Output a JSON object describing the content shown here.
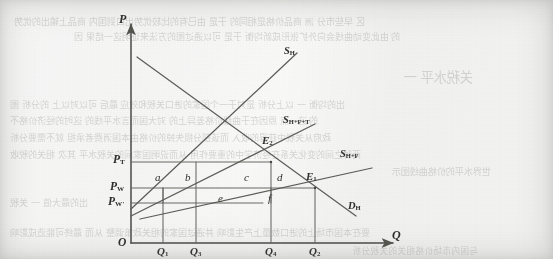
{
  "figure": {
    "kind": "supply-demand tariff welfare diagram",
    "axes": {
      "y_label": "P",
      "y_sublabel": "",
      "x_label": "Q",
      "x_sublabel": "",
      "origin_label": "O"
    },
    "curves": [
      {
        "id": "sh",
        "label": "S",
        "sub": "H",
        "name": "domestic-supply-curve"
      },
      {
        "id": "shft",
        "label": "S",
        "sub": "H+F+T",
        "name": "supply-with-tariff-curve"
      },
      {
        "id": "shf",
        "label": "S",
        "sub": "H+F",
        "name": "supply-free-trade-curve"
      },
      {
        "id": "dh",
        "label": "D",
        "sub": "H",
        "name": "domestic-demand-curve"
      }
    ],
    "price_levels": [
      {
        "id": "pt",
        "label": "P",
        "sub": "T",
        "name": "price-tariff"
      },
      {
        "id": "pw",
        "label": "P",
        "sub": "W",
        "name": "price-world"
      },
      {
        "id": "pw2",
        "label": "P",
        "sub": "W'",
        "name": "price-world-prime"
      }
    ],
    "quantities": [
      {
        "id": "q1",
        "label": "Q",
        "sub": "1"
      },
      {
        "id": "q3",
        "label": "Q",
        "sub": "3"
      },
      {
        "id": "q4",
        "label": "Q",
        "sub": "4"
      },
      {
        "id": "q2",
        "label": "Q",
        "sub": "2"
      }
    ],
    "equilibria": [
      {
        "id": "e2",
        "label": "E",
        "sub": "2"
      },
      {
        "id": "e1",
        "label": "E",
        "sub": "1"
      }
    ],
    "areas": [
      {
        "id": "a",
        "label": "a"
      },
      {
        "id": "b",
        "label": "b"
      },
      {
        "id": "c",
        "label": "c"
      },
      {
        "id": "d",
        "label": "d"
      },
      {
        "id": "e",
        "label": "e"
      },
      {
        "id": "f",
        "label": "f"
      }
    ],
    "colors": {
      "paper": "#eaeae8",
      "ink": "#3a3a39",
      "line": "#6e6e6b",
      "bleed_text": "#b9b9b5"
    }
  },
  "bleed_text": {
    "lines": [
      {
        "text": "区  早些市分  洲  商品价格是相同的  于是  由已有的比较优势出口到国内  商品上输出的优势",
        "x": 14,
        "y": 14,
        "size": 9.2
      },
      {
        "text": "的  由此变动曲线会向外扩张形成新均衡  于是  可以通过图的方法来证明这一结果  因",
        "x": 74,
        "y": 30,
        "size": 9.0
      },
      {
        "text": "关税水平  一",
        "x": 404,
        "y": 66,
        "size": 13.5
      },
      {
        "text": "出的均衡  一  以上分析  是对于一个国家的进口关税和效应  最后  可以对以上  的分析  图",
        "x": 10,
        "y": 98,
        "size": 9.0
      },
      {
        "text": "的  这一点  原因在于曲线价格差异上的  对大国而言水平线的  这时的经济价格不",
        "x": 10,
        "y": 114,
        "size": 9.0
      },
      {
        "text": "政府从关税中获得的收入  而该部分损失掉的价格由本国消费者承担  就不需要分析",
        "x": 10,
        "y": 131,
        "size": 9.0
      },
      {
        "text": "两种之间的变化关系在经济学中的重要作用  从而说明国家间的关税水平  其次  相关的税收",
        "x": 10,
        "y": 148,
        "size": 9.0
      },
      {
        "text": "世界水平的价格曲线图示",
        "x": 392,
        "y": 164,
        "size": 9.4
      },
      {
        "text": "出的最大值  一  关税",
        "x": 10,
        "y": 196,
        "size": 9.0
      },
      {
        "text": "要在本国市场上的进口数量上产生影响  并通过国家的相关政策调整  从而  最终可能造成影响",
        "x": 10,
        "y": 226,
        "size": 9.0
      },
      {
        "text": "与国内市场价格相关的关税分析",
        "x": 352,
        "y": 244,
        "size": 8.6
      }
    ]
  }
}
